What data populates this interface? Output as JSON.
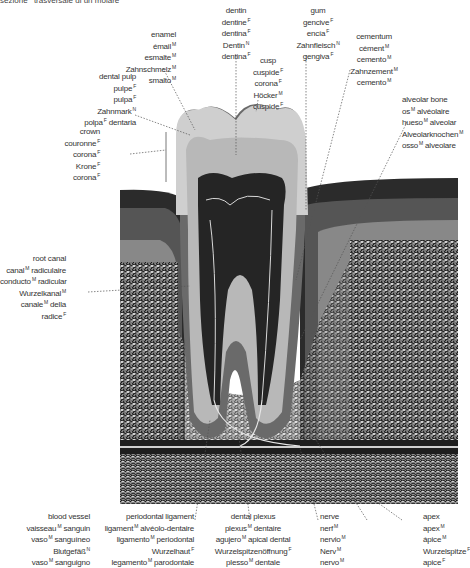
{
  "title": {
    "text": "sezione",
    "g1": "F",
    "text2": "trasversale di un molare",
    "g2": "M"
  },
  "labels": {
    "enamel": [
      {
        "t": "enamel",
        "g": ""
      },
      {
        "t": "émail",
        "g": "M"
      },
      {
        "t": "esmalte",
        "g": "M"
      },
      {
        "t": "Zahnschmelz",
        "g": "M"
      },
      {
        "t": "smalto",
        "g": "M"
      }
    ],
    "dentin": [
      {
        "t": "dentin",
        "g": ""
      },
      {
        "t": "dentine",
        "g": "F"
      },
      {
        "t": "dentina",
        "g": "F"
      },
      {
        "t": "Dentin",
        "g": "N"
      },
      {
        "t": "dentina",
        "g": "F"
      }
    ],
    "gum": [
      {
        "t": "gum",
        "g": ""
      },
      {
        "t": "gencive",
        "g": "F"
      },
      {
        "t": "encía",
        "g": "F"
      },
      {
        "t": "Zahnfleisch",
        "g": "N"
      },
      {
        "t": "gengiva",
        "g": "F"
      }
    ],
    "cementum": [
      {
        "t": "cementum",
        "g": ""
      },
      {
        "t": "cément",
        "g": "M"
      },
      {
        "t": "cemento",
        "g": "M"
      },
      {
        "t": "Zahnzement",
        "g": "M"
      },
      {
        "t": "cemento",
        "g": "M"
      }
    ],
    "cusp": [
      {
        "t": "cusp",
        "g": ""
      },
      {
        "t": "cuspide",
        "g": "F"
      },
      {
        "t": "corona",
        "g": "F"
      },
      {
        "t": "Höcker",
        "g": "M"
      },
      {
        "t": "cuspide",
        "g": "F"
      }
    ],
    "dental_pulp": [
      {
        "t": "dental pulp",
        "g": ""
      },
      {
        "t": "pulpe",
        "g": "F"
      },
      {
        "t": "pulpa",
        "g": "F"
      },
      {
        "t": "Zahnmark",
        "g": "N"
      },
      {
        "t": "polpa",
        "g": "F",
        "after": "dentaria"
      }
    ],
    "crown": [
      {
        "t": "crown",
        "g": ""
      },
      {
        "t": "couronne",
        "g": "F"
      },
      {
        "t": "corona",
        "g": "F"
      },
      {
        "t": "Krone",
        "g": "F"
      },
      {
        "t": "corona",
        "g": "F"
      }
    ],
    "alveolar_bone": [
      {
        "t": "alveolar bone",
        "g": ""
      },
      {
        "t": "os",
        "g": "M",
        "after": "alvéolaire"
      },
      {
        "t": "hueso",
        "g": "M",
        "after": "alveolar"
      },
      {
        "t": "Alveolarknochen",
        "g": "M"
      },
      {
        "t": "osso",
        "g": "M",
        "after": "alveolare"
      }
    ],
    "root_canal": [
      {
        "t": "root canal",
        "g": ""
      },
      {
        "t": "canal",
        "g": "M",
        "after": "radiculaire"
      },
      {
        "t": "conducto",
        "g": "M",
        "after": "radicular"
      },
      {
        "t": "Wurzelkanal",
        "g": "M"
      },
      {
        "t": "canale",
        "g": "M",
        "after": "della"
      },
      {
        "t": "radice",
        "g": "F"
      }
    ],
    "blood_vessel": [
      {
        "t": "blood vessel",
        "g": ""
      },
      {
        "t": "vaisseau",
        "g": "M",
        "after": "sanguin"
      },
      {
        "t": "vaso",
        "g": "M",
        "after": "sanguíneo"
      },
      {
        "t": "Blutgefäß",
        "g": "N"
      },
      {
        "t": "vaso",
        "g": "M",
        "after": "sanguigno"
      }
    ],
    "periodontal_ligament": [
      {
        "t": "periodontal ligament",
        "g": ""
      },
      {
        "t": "ligament",
        "g": "M",
        "after": "alvéolo-dentaire"
      },
      {
        "t": "ligamento",
        "g": "M",
        "after": "periodontal"
      },
      {
        "t": "Wurzelhaut",
        "g": "F"
      },
      {
        "t": "legamento",
        "g": "M",
        "after": "parodontale"
      }
    ],
    "dental_plexus": [
      {
        "t": "dental plexus",
        "g": ""
      },
      {
        "t": "plexus",
        "g": "M",
        "after": "dentaire"
      },
      {
        "t": "agujero",
        "g": "M",
        "after": "apical dental"
      },
      {
        "t": "Wurzelspitzenöffnung",
        "g": "F"
      },
      {
        "t": "plesso",
        "g": "M",
        "after": "dentale"
      }
    ],
    "nerve": [
      {
        "t": "nerve",
        "g": ""
      },
      {
        "t": "nerf",
        "g": "M"
      },
      {
        "t": "nervio",
        "g": "M"
      },
      {
        "t": "Nerv",
        "g": "M"
      },
      {
        "t": "nervo",
        "g": "M"
      }
    ],
    "apex": [
      {
        "t": "apex",
        "g": ""
      },
      {
        "t": "apex",
        "g": "M"
      },
      {
        "t": "ápice",
        "g": "M"
      },
      {
        "t": "Wurzelspitze",
        "g": "F"
      },
      {
        "t": "apice",
        "g": "F"
      }
    ]
  },
  "colors": {
    "enamel": "#c8c8c8",
    "dentin": "#b0b0b0",
    "pulp": "#2a2a2a",
    "gum_dark": "#2e2e2e",
    "gum_mid": "#555555",
    "bone": "#8a8a8a",
    "leader": "#555555"
  }
}
